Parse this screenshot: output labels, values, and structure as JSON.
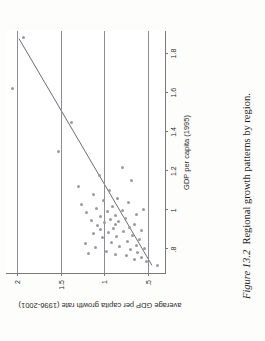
{
  "caption": {
    "label": "Figure 13.2",
    "text": "Regional growth patterns by region."
  },
  "chart_data": {
    "type": "scatter",
    "title": "",
    "xlabel": "GDP per capita (1995)",
    "ylabel": "average GDP per capita growth rate (1996-2001)",
    "xlim": [
      0.68,
      1.92
    ],
    "ylim": [
      0.3,
      2.12
    ],
    "xticks": [
      0.8,
      1.0,
      1.2,
      1.4,
      1.6,
      1.8
    ],
    "xticklabels": [
      ".8",
      "1",
      "1.2",
      "1.4",
      "1.6",
      "1.8"
    ],
    "yticks": [
      0.5,
      1.0,
      1.5,
      2.0
    ],
    "yticklabels": [
      ".5",
      "1",
      "1.5",
      "2"
    ],
    "grid": true,
    "gridlines_y": [
      0.5,
      1.0,
      1.5,
      2.0
    ],
    "legend": "none",
    "marker_color": "#9b9b9b",
    "line_color": "#6e6e6e",
    "grid_color": "#8d8d9a",
    "axis_color": "#7a7a7a",
    "rotation_deg": -90,
    "series": [
      {
        "name": "regions",
        "points": [
          [
            0.72,
            0.4
          ],
          [
            0.74,
            0.52
          ],
          [
            0.75,
            0.66
          ],
          [
            0.76,
            0.58
          ],
          [
            0.77,
            0.75
          ],
          [
            0.775,
            0.88
          ],
          [
            0.78,
            1.18
          ],
          [
            0.785,
            0.62
          ],
          [
            0.79,
            0.98
          ],
          [
            0.8,
            0.7
          ],
          [
            0.805,
            0.55
          ],
          [
            0.81,
            1.1
          ],
          [
            0.815,
            0.83
          ],
          [
            0.82,
            0.64
          ],
          [
            0.83,
            1.22
          ],
          [
            0.835,
            0.92
          ],
          [
            0.84,
            0.74
          ],
          [
            0.85,
            0.6
          ],
          [
            0.86,
            1.02
          ],
          [
            0.865,
            0.86
          ],
          [
            0.87,
            0.68
          ],
          [
            0.88,
            1.12
          ],
          [
            0.885,
            0.95
          ],
          [
            0.89,
            0.78
          ],
          [
            0.895,
            0.58
          ],
          [
            0.9,
            1.05
          ],
          [
            0.905,
            0.9
          ],
          [
            0.91,
            0.72
          ],
          [
            0.92,
            1.08
          ],
          [
            0.925,
            0.88
          ],
          [
            0.93,
            0.66
          ],
          [
            0.94,
            1.0
          ],
          [
            0.945,
            0.84
          ],
          [
            0.95,
            1.15
          ],
          [
            0.955,
            0.93
          ],
          [
            0.96,
            0.76
          ],
          [
            0.97,
            1.04
          ],
          [
            0.975,
            0.87
          ],
          [
            0.98,
            0.63
          ],
          [
            0.99,
            1.2
          ],
          [
            0.995,
            0.97
          ],
          [
            1.0,
            0.8
          ],
          [
            1.005,
            0.56
          ],
          [
            1.01,
            1.09
          ],
          [
            1.02,
            0.91
          ],
          [
            1.03,
            1.26
          ],
          [
            1.04,
            0.73
          ],
          [
            1.05,
            1.01
          ],
          [
            1.06,
            0.85
          ],
          [
            1.08,
            1.13
          ],
          [
            1.1,
            0.94
          ],
          [
            1.12,
            1.3
          ],
          [
            1.15,
            0.69
          ],
          [
            1.18,
            1.06
          ],
          [
            1.22,
            0.79
          ],
          [
            1.3,
            1.52
          ],
          [
            1.45,
            1.38
          ],
          [
            1.62,
            2.05
          ],
          [
            1.88,
            1.92
          ]
        ]
      }
    ],
    "fit_line": {
      "name": "fitted values",
      "x": [
        0.72,
        1.88
      ],
      "y": [
        0.45,
        1.97
      ],
      "slope": 1.31,
      "intercept": -0.49
    }
  }
}
